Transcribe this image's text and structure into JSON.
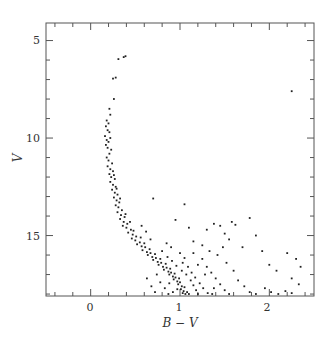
{
  "chart_data": {
    "type": "scatter",
    "title": "",
    "xlabel": "B − V",
    "ylabel": "V",
    "xlim": [
      -0.5,
      2.5
    ],
    "ylim": [
      18.1,
      4.1
    ],
    "y_inverted": true,
    "grid": false,
    "legend": null,
    "x_ticks": [
      {
        "value": 0,
        "label": "0"
      },
      {
        "value": 1,
        "label": "1"
      },
      {
        "value": 2,
        "label": "2"
      }
    ],
    "x_minor_step": 0.2,
    "y_ticks": [
      {
        "value": 5,
        "label": "5"
      },
      {
        "value": 10,
        "label": "10"
      },
      {
        "value": 15,
        "label": "15"
      }
    ],
    "y_minor_step": 1,
    "marker_color": "#222222",
    "series": [
      {
        "name": "stars",
        "points": [
          [
            0.31,
            5.95
          ],
          [
            0.37,
            5.85
          ],
          [
            0.39,
            5.8
          ],
          [
            0.25,
            6.95
          ],
          [
            0.28,
            6.9
          ],
          [
            0.26,
            8.0
          ],
          [
            0.21,
            8.5
          ],
          [
            0.22,
            8.8
          ],
          [
            0.18,
            9.1
          ],
          [
            0.2,
            9.25
          ],
          [
            0.17,
            9.4
          ],
          [
            0.19,
            9.6
          ],
          [
            0.21,
            9.7
          ],
          [
            0.16,
            9.9
          ],
          [
            0.18,
            10.1
          ],
          [
            0.2,
            10.2
          ],
          [
            0.22,
            10.0
          ],
          [
            0.17,
            10.35
          ],
          [
            0.19,
            10.5
          ],
          [
            0.23,
            10.6
          ],
          [
            0.21,
            10.8
          ],
          [
            0.18,
            11.0
          ],
          [
            0.2,
            11.15
          ],
          [
            0.24,
            11.3
          ],
          [
            0.19,
            11.45
          ],
          [
            0.22,
            11.6
          ],
          [
            0.25,
            11.7
          ],
          [
            0.21,
            11.85
          ],
          [
            0.23,
            12.0
          ],
          [
            0.27,
            12.1
          ],
          [
            0.22,
            12.25
          ],
          [
            0.25,
            12.4
          ],
          [
            0.28,
            12.5
          ],
          [
            0.24,
            12.65
          ],
          [
            0.27,
            12.8
          ],
          [
            0.3,
            12.9
          ],
          [
            0.26,
            13.05
          ],
          [
            0.29,
            13.2
          ],
          [
            0.32,
            13.3
          ],
          [
            0.28,
            13.45
          ],
          [
            0.31,
            13.55
          ],
          [
            0.35,
            13.7
          ],
          [
            0.3,
            13.8
          ],
          [
            0.34,
            13.95
          ],
          [
            0.38,
            14.05
          ],
          [
            0.33,
            14.15
          ],
          [
            0.37,
            14.3
          ],
          [
            0.41,
            14.4
          ],
          [
            0.36,
            14.5
          ],
          [
            0.4,
            14.6
          ],
          [
            0.45,
            14.7
          ],
          [
            0.42,
            14.85
          ],
          [
            0.47,
            14.95
          ],
          [
            0.51,
            15.05
          ],
          [
            0.46,
            15.15
          ],
          [
            0.5,
            15.25
          ],
          [
            0.55,
            15.35
          ],
          [
            0.52,
            15.45
          ],
          [
            0.57,
            15.55
          ],
          [
            0.61,
            15.6
          ],
          [
            0.58,
            15.75
          ],
          [
            0.63,
            15.85
          ],
          [
            0.67,
            15.9
          ],
          [
            0.64,
            16.0
          ],
          [
            0.69,
            16.1
          ],
          [
            0.73,
            16.15
          ],
          [
            0.7,
            16.25
          ],
          [
            0.75,
            16.35
          ],
          [
            0.79,
            16.4
          ],
          [
            0.76,
            16.5
          ],
          [
            0.81,
            16.6
          ],
          [
            0.85,
            16.65
          ],
          [
            0.82,
            16.75
          ],
          [
            0.87,
            16.85
          ],
          [
            0.9,
            16.9
          ],
          [
            0.88,
            17.0
          ],
          [
            0.92,
            17.1
          ],
          [
            0.95,
            17.15
          ],
          [
            0.93,
            17.25
          ],
          [
            0.97,
            17.35
          ],
          [
            1.0,
            17.4
          ],
          [
            0.98,
            17.5
          ],
          [
            1.02,
            17.6
          ],
          [
            1.05,
            17.65
          ],
          [
            1.01,
            17.75
          ],
          [
            1.04,
            17.85
          ],
          [
            1.08,
            17.9
          ],
          [
            1.03,
            17.95
          ],
          [
            1.06,
            18.0
          ],
          [
            1.1,
            18.0
          ],
          [
            0.26,
            11.9
          ],
          [
            0.29,
            12.6
          ],
          [
            0.33,
            13.1
          ],
          [
            0.39,
            13.9
          ],
          [
            0.44,
            14.3
          ],
          [
            0.48,
            14.75
          ],
          [
            0.56,
            15.1
          ],
          [
            0.6,
            15.4
          ],
          [
            0.66,
            15.7
          ],
          [
            0.72,
            15.95
          ],
          [
            0.78,
            16.2
          ],
          [
            0.84,
            16.45
          ],
          [
            0.89,
            16.7
          ],
          [
            0.94,
            16.95
          ],
          [
            0.99,
            17.2
          ],
          [
            0.8,
            15.8
          ],
          [
            0.86,
            16.1
          ],
          [
            0.91,
            16.3
          ],
          [
            0.96,
            16.55
          ],
          [
            1.02,
            16.8
          ],
          [
            1.07,
            17.0
          ],
          [
            1.12,
            17.3
          ],
          [
            1.15,
            17.55
          ],
          [
            1.18,
            17.8
          ],
          [
            1.2,
            18.0
          ],
          [
            0.74,
            17.0
          ],
          [
            0.78,
            17.4
          ],
          [
            0.83,
            17.7
          ],
          [
            0.87,
            18.0
          ],
          [
            0.92,
            17.9
          ],
          [
            1.25,
            16.2
          ],
          [
            1.3,
            16.6
          ],
          [
            1.35,
            16.9
          ],
          [
            1.4,
            17.2
          ],
          [
            1.45,
            17.5
          ],
          [
            1.5,
            17.8
          ],
          [
            1.55,
            18.0
          ],
          [
            1.15,
            15.9
          ],
          [
            1.2,
            16.5
          ],
          [
            1.28,
            17.0
          ],
          [
            1.38,
            17.7
          ],
          [
            1.42,
            16.0
          ],
          [
            1.52,
            16.4
          ],
          [
            1.6,
            16.8
          ],
          [
            1.65,
            17.3
          ],
          [
            1.72,
            17.6
          ],
          [
            1.78,
            17.9
          ],
          [
            1.85,
            18.0
          ],
          [
            1.95,
            17.7
          ],
          [
            2.02,
            17.9
          ],
          [
            2.1,
            18.0
          ],
          [
            2.18,
            17.85
          ],
          [
            2.25,
            17.95
          ],
          [
            1.3,
            14.7
          ],
          [
            1.38,
            14.4
          ],
          [
            1.45,
            14.5
          ],
          [
            1.5,
            14.9
          ],
          [
            1.55,
            15.2
          ],
          [
            1.62,
            14.45
          ],
          [
            1.7,
            15.6
          ],
          [
            1.78,
            14.1
          ],
          [
            1.85,
            15.0
          ],
          [
            1.92,
            15.8
          ],
          [
            2.0,
            16.5
          ],
          [
            2.08,
            16.8
          ],
          [
            2.2,
            15.9
          ],
          [
            2.3,
            16.2
          ],
          [
            2.35,
            16.6
          ],
          [
            2.25,
            17.2
          ],
          [
            2.33,
            17.5
          ],
          [
            1.1,
            14.6
          ],
          [
            1.15,
            15.3
          ],
          [
            0.95,
            14.2
          ],
          [
            0.7,
            13.1
          ],
          [
            1.05,
            13.4
          ],
          [
            2.25,
            7.6
          ],
          [
            1.58,
            14.3
          ],
          [
            1.25,
            15.5
          ],
          [
            1.33,
            15.8
          ],
          [
            1.48,
            15.6
          ],
          [
            0.63,
            17.2
          ],
          [
            0.68,
            17.6
          ],
          [
            0.72,
            17.9
          ],
          [
            0.88,
            17.45
          ],
          [
            0.97,
            17.75
          ],
          [
            1.03,
            16.4
          ],
          [
            1.09,
            16.6
          ],
          [
            1.13,
            16.9
          ],
          [
            1.17,
            17.15
          ],
          [
            1.22,
            17.45
          ],
          [
            1.26,
            17.7
          ],
          [
            1.31,
            17.95
          ],
          [
            1.36,
            18.0
          ],
          [
            0.85,
            15.4
          ],
          [
            0.9,
            15.6
          ],
          [
            1.0,
            15.9
          ],
          [
            1.05,
            16.15
          ],
          [
            0.62,
            14.8
          ],
          [
            0.67,
            15.2
          ],
          [
            0.57,
            14.5
          ]
        ]
      }
    ]
  },
  "axes": {
    "x_title": "B − V",
    "y_title": "V",
    "x_tick_labels": [
      "0",
      "1",
      "2"
    ],
    "y_tick_labels": [
      "5",
      "10",
      "15"
    ]
  }
}
